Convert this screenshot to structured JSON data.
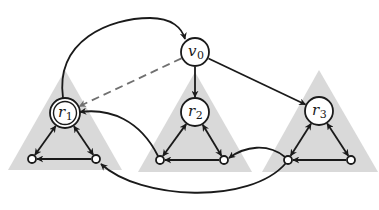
{
  "diagram": {
    "type": "directed-graph",
    "colors": {
      "edge": "#1a1a1a",
      "dashed_edge": "#707070",
      "triangle_fill": "#d9d9d9",
      "node_fill": "#ffffff",
      "node_stroke": "#1a1a1a"
    },
    "nodes": [
      {
        "id": "v0",
        "base": "v",
        "sub": "0",
        "kind": "circle"
      },
      {
        "id": "r1",
        "base": "r",
        "sub": "1",
        "kind": "double-circle"
      },
      {
        "id": "r2",
        "base": "r",
        "sub": "2",
        "kind": "circle"
      },
      {
        "id": "r3",
        "base": "r",
        "sub": "3",
        "kind": "circle"
      },
      {
        "id": "a1",
        "kind": "small"
      },
      {
        "id": "b1",
        "kind": "small"
      },
      {
        "id": "a2",
        "kind": "small"
      },
      {
        "id": "b2",
        "kind": "small"
      },
      {
        "id": "a3",
        "kind": "small"
      },
      {
        "id": "b3",
        "kind": "small"
      }
    ],
    "triangles": [
      {
        "id": "t1",
        "root": "r1"
      },
      {
        "id": "t2",
        "root": "r2"
      },
      {
        "id": "t3",
        "root": "r3"
      }
    ],
    "edges": [
      {
        "from": "r1",
        "to": "v0",
        "style": "solid",
        "curve": "arc-over"
      },
      {
        "from": "v0",
        "to": "r1",
        "style": "dashed"
      },
      {
        "from": "v0",
        "to": "r2",
        "style": "solid"
      },
      {
        "from": "v0",
        "to": "r3",
        "style": "solid"
      },
      {
        "from": "r1",
        "to": "a1",
        "style": "solid",
        "bidirectional": true
      },
      {
        "from": "r1",
        "to": "b1",
        "style": "solid",
        "bidirectional": true
      },
      {
        "from": "b1",
        "to": "a1",
        "style": "solid"
      },
      {
        "from": "r2",
        "to": "a2",
        "style": "solid",
        "bidirectional": true
      },
      {
        "from": "r2",
        "to": "b2",
        "style": "solid",
        "bidirectional": true
      },
      {
        "from": "b2",
        "to": "a2",
        "style": "solid"
      },
      {
        "from": "r3",
        "to": "a3",
        "style": "solid",
        "bidirectional": true
      },
      {
        "from": "r3",
        "to": "b3",
        "style": "solid",
        "bidirectional": true
      },
      {
        "from": "b3",
        "to": "a3",
        "style": "solid"
      },
      {
        "from": "a2",
        "to": "r1",
        "style": "solid",
        "curve": "arc"
      },
      {
        "from": "a3",
        "to": "b2",
        "style": "solid",
        "curve": "arc"
      },
      {
        "from": "a3",
        "to": "b1",
        "style": "solid",
        "curve": "arc-under"
      }
    ]
  }
}
